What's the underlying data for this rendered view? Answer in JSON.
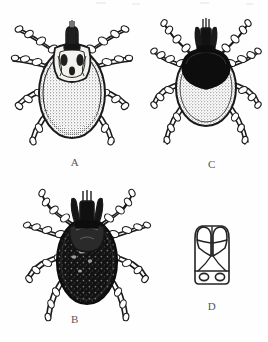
{
  "plate": {
    "title": "Tick identification plate",
    "description": "Black-and-white scanned scientific illustration plate of four tick figures",
    "background_color": "#fefefe",
    "ink_color": "#1a1a1a",
    "label_color": "#58565a",
    "width": 268,
    "height": 342
  },
  "panels": [
    {
      "key": "A",
      "label": "A",
      "name": "tick-figure-a",
      "position": "top-left",
      "body_tone": "pale stippled",
      "scutum": "patterned ornate scutum",
      "leg_count": 8
    },
    {
      "key": "C",
      "label": "C",
      "name": "tick-figure-c",
      "position": "top-right",
      "body_tone": "pale stippled abdomen",
      "scutum": "solid black scutum",
      "leg_count": 8
    },
    {
      "key": "B",
      "label": "B",
      "name": "tick-figure-b",
      "position": "bottom-left",
      "body_tone": "dark mottled body",
      "scutum": "dark scutum",
      "leg_count": 8
    },
    {
      "key": "D",
      "label": "D",
      "name": "capitulum-diagram-d",
      "position": "bottom-right",
      "body_tone": "line drawing outline",
      "scutum": "basis capituli with two porose areas and paired palps",
      "leg_count": 0
    }
  ]
}
